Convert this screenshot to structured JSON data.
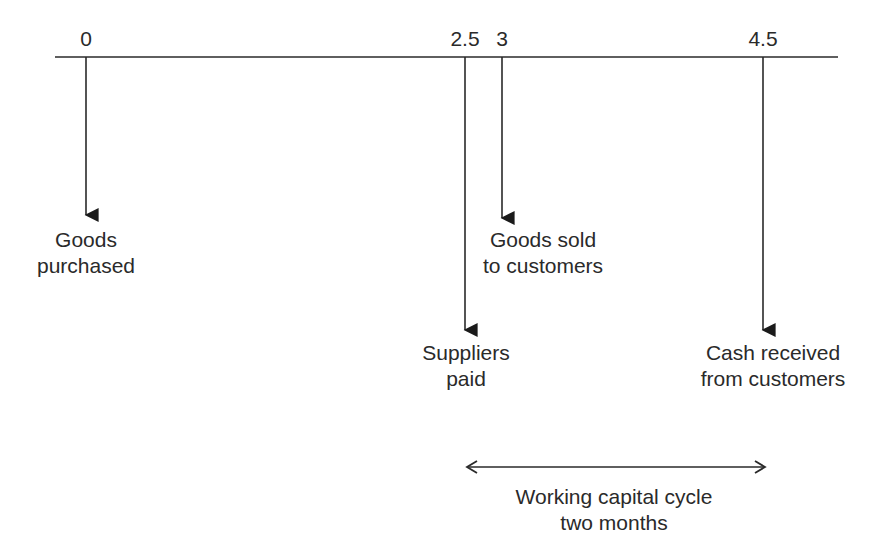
{
  "diagram": {
    "type": "timeline",
    "axis": {
      "x_start": 55,
      "x_end": 838,
      "y": 57,
      "color": "#2a2a2a"
    },
    "ticks": [
      {
        "label": "0",
        "x": 86
      },
      {
        "label": "2.5",
        "x": 465
      },
      {
        "label": "3",
        "x": 502
      },
      {
        "label": "4.5",
        "x": 763
      }
    ],
    "events": [
      {
        "time": "0",
        "x": 86,
        "arrow_end_y": 215,
        "line1": "Goods",
        "line2": "purchased",
        "label_x": 86,
        "label_y": 227
      },
      {
        "time": "2.5",
        "x": 465,
        "arrow_end_y": 330,
        "line1": "Suppliers",
        "line2": "paid",
        "label_x": 466,
        "label_y": 340
      },
      {
        "time": "3",
        "x": 502,
        "arrow_end_y": 218,
        "line1": "Goods sold",
        "line2": "to customers",
        "label_x": 543,
        "label_y": 227
      },
      {
        "time": "4.5",
        "x": 763,
        "arrow_end_y": 330,
        "line1": "Cash received",
        "line2": "from customers",
        "label_x": 773,
        "label_y": 340
      }
    ],
    "span": {
      "x_start": 467,
      "x_end": 765,
      "y": 467,
      "line1": "Working capital cycle",
      "line2": "two months",
      "label_x": 614,
      "label_y": 484
    }
  }
}
